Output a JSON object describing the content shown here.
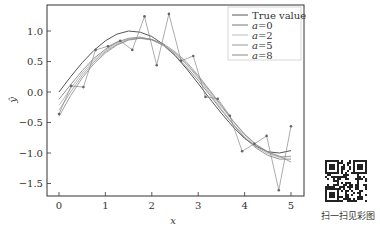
{
  "chart_data": {
    "type": "line",
    "title": "",
    "xlabel": "x",
    "ylabel": "ŷ",
    "xlim": [
      -0.25,
      5.25
    ],
    "ylim": [
      -1.8,
      1.45
    ],
    "xticks": [
      0,
      1,
      2,
      3,
      4,
      5
    ],
    "xtick_labels": [
      "0",
      "1",
      "2",
      "3",
      "4",
      "5"
    ],
    "yticks": [
      1.0,
      0.5,
      0.0,
      -0.5,
      -1.0,
      -1.5
    ],
    "ytick_labels": [
      "1.0",
      "0.5",
      "0.0",
      "−0.5",
      "−1.0",
      "−1.5"
    ],
    "grid": false,
    "legend_position": "upper right",
    "observed": {
      "x": [
        0,
        0.263,
        0.526,
        0.789,
        1.053,
        1.316,
        1.579,
        1.842,
        2.105,
        2.368,
        2.632,
        2.895,
        3.158,
        3.421,
        3.684,
        3.947,
        4.211,
        4.474,
        4.737,
        5.0
      ],
      "y": [
        -0.36,
        0.1,
        0.08,
        0.69,
        0.75,
        0.84,
        0.69,
        1.24,
        0.44,
        1.28,
        0.51,
        0.59,
        -0.08,
        -0.11,
        -0.39,
        -0.97,
        -0.85,
        -0.72,
        -1.61,
        -0.56
      ]
    },
    "series": [
      {
        "name": "True value",
        "color": "#555555",
        "width": 1.0,
        "x": [
          0,
          0.25,
          0.5,
          0.75,
          1,
          1.25,
          1.5,
          1.75,
          2,
          2.25,
          2.5,
          2.75,
          3,
          3.25,
          3.5,
          3.75,
          4,
          4.25,
          4.5,
          4.75,
          5
        ],
        "y": [
          0.0,
          0.25,
          0.48,
          0.68,
          0.84,
          0.95,
          1.0,
          0.98,
          0.91,
          0.78,
          0.6,
          0.38,
          0.14,
          -0.11,
          -0.35,
          -0.57,
          -0.76,
          -0.89,
          -0.98,
          -1.0,
          -0.96
        ]
      },
      {
        "name": "a=0",
        "color": "#777777",
        "width": 0.8,
        "x": [
          0,
          0.25,
          0.5,
          0.75,
          1,
          1.25,
          1.5,
          1.75,
          2,
          2.25,
          2.5,
          2.75,
          3,
          3.25,
          3.5,
          3.75,
          4,
          4.25,
          4.5,
          4.75,
          5
        ],
        "y": [
          -0.12,
          0.12,
          0.35,
          0.55,
          0.7,
          0.82,
          0.88,
          0.9,
          0.86,
          0.76,
          0.6,
          0.41,
          0.19,
          -0.05,
          -0.3,
          -0.53,
          -0.75,
          -0.92,
          -1.04,
          -1.1,
          -1.1
        ]
      },
      {
        "name": "a=2",
        "color": "#aaaaaa",
        "width": 0.8,
        "x": [
          0,
          0.25,
          0.5,
          0.75,
          1,
          1.25,
          1.5,
          1.75,
          2,
          2.25,
          2.5,
          2.75,
          3,
          3.25,
          3.5,
          3.75,
          4,
          4.25,
          4.5,
          4.75,
          5
        ],
        "y": [
          -0.22,
          0.06,
          0.31,
          0.52,
          0.68,
          0.8,
          0.87,
          0.89,
          0.86,
          0.77,
          0.63,
          0.45,
          0.23,
          -0.02,
          -0.28,
          -0.52,
          -0.73,
          -0.9,
          -1.01,
          -1.07,
          -1.05
        ]
      },
      {
        "name": "a=5",
        "color": "#999999",
        "width": 0.8,
        "x": [
          0,
          0.25,
          0.5,
          0.75,
          1,
          1.25,
          1.5,
          1.75,
          2,
          2.25,
          2.5,
          2.75,
          3,
          3.25,
          3.5,
          3.75,
          4,
          4.25,
          4.5,
          4.75,
          5
        ],
        "y": [
          -0.3,
          0.0,
          0.27,
          0.49,
          0.66,
          0.78,
          0.86,
          0.88,
          0.85,
          0.77,
          0.64,
          0.46,
          0.25,
          0.01,
          -0.24,
          -0.48,
          -0.7,
          -0.87,
          -0.99,
          -1.06,
          -1.06
        ]
      },
      {
        "name": "a=8",
        "color": "#888888",
        "width": 0.8,
        "x": [
          0,
          0.25,
          0.5,
          0.75,
          1,
          1.25,
          1.5,
          1.75,
          2,
          2.25,
          2.5,
          2.75,
          3,
          3.25,
          3.5,
          3.75,
          4,
          4.25,
          4.5,
          4.75,
          5
        ],
        "y": [
          -0.4,
          -0.06,
          0.23,
          0.46,
          0.64,
          0.77,
          0.85,
          0.88,
          0.86,
          0.79,
          0.66,
          0.49,
          0.27,
          0.03,
          -0.22,
          -0.47,
          -0.69,
          -0.86,
          -0.98,
          -1.05,
          -1.15
        ]
      }
    ],
    "legend_entries": [
      "True value",
      "a=0",
      "a=2",
      "a=5",
      "a=8"
    ]
  },
  "legend": {
    "items": [
      {
        "label": "True value",
        "color": "#555555"
      },
      {
        "label": "a=0",
        "color": "#777777"
      },
      {
        "label": "a=2",
        "color": "#bbbbbb"
      },
      {
        "label": "a=5",
        "color": "#999999"
      },
      {
        "label": "a=8",
        "color": "#888888"
      }
    ]
  },
  "qr": {
    "caption": "扫一扫见彩图"
  }
}
